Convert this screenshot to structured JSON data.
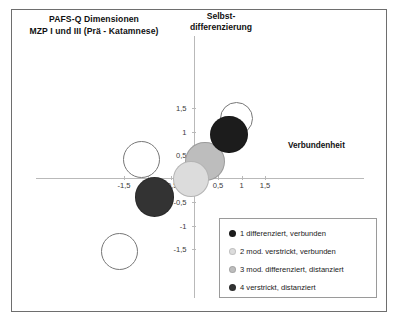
{
  "chart_data": {
    "type": "scatter",
    "title": "PAFS-Q Dimensionen\nMZP I und III (Prä - Katamnese)",
    "title_line1": "PAFS-Q Dimensionen",
    "title_line2": "MZP I und III (Prä - Katamnese)",
    "xlabel": "Verbundenheit",
    "ylabel_line1": "Selbst-",
    "ylabel_line2": "differenzierung",
    "xlim": [
      -1.75,
      1.75
    ],
    "ylim": [
      -1.75,
      1.75
    ],
    "grid": false,
    "legend_position": "bottom-right",
    "xticks": [
      "-1,5",
      "-1",
      "-0,5",
      "0",
      "0,5",
      "1",
      "1,5"
    ],
    "xtick_values": [
      -1.5,
      -1.0,
      -0.5,
      0,
      0.5,
      1.0,
      1.5
    ],
    "yticks": [
      "1,5",
      "1",
      "0,5",
      "0",
      "-0,5",
      "-1",
      "-1,5"
    ],
    "ytick_values": [
      1.5,
      1.0,
      0.5,
      0,
      -0.5,
      -1.0,
      -1.5
    ],
    "series": [
      {
        "name": "1 differenziert, verbunden",
        "color": "#1c1c1c",
        "style": "filled",
        "points": [
          {
            "x": 0.74,
            "y": 0.94,
            "r": 0.4
          }
        ]
      },
      {
        "name": "2 mod. verstrickt, verbunden",
        "color": "#dcdcdc",
        "style": "filled",
        "points": [
          {
            "x": -0.08,
            "y": -0.01,
            "r": 0.38
          }
        ]
      },
      {
        "name": "3 mod. differenziert, distanziert",
        "color": "#bdbdbd",
        "style": "filled",
        "points": [
          {
            "x": 0.22,
            "y": 0.36,
            "r": 0.42
          }
        ]
      },
      {
        "name": "4 verstrickt, distanziert",
        "color": "#333333",
        "style": "filled",
        "points": [
          {
            "x": -0.85,
            "y": -0.39,
            "r": 0.42
          }
        ]
      },
      {
        "name": "Katamnese (MZP III) Umrisse",
        "color": "#777777",
        "style": "outline",
        "points": [
          {
            "x": 0.9,
            "y": 1.28,
            "r": 0.35
          },
          {
            "x": -1.13,
            "y": 0.4,
            "r": 0.4
          },
          {
            "x": -1.6,
            "y": -1.55,
            "r": 0.4
          }
        ]
      }
    ]
  },
  "legend": {
    "items": [
      {
        "label": "1 differenziert, verbunden",
        "color": "#1c1c1c"
      },
      {
        "label": "2 mod. verstrickt, verbunden",
        "color": "#dcdcdc"
      },
      {
        "label": "3 mod. differenziert, distanziert",
        "color": "#bdbdbd"
      },
      {
        "label": "4 verstrickt, distanziert",
        "color": "#333333"
      }
    ]
  }
}
